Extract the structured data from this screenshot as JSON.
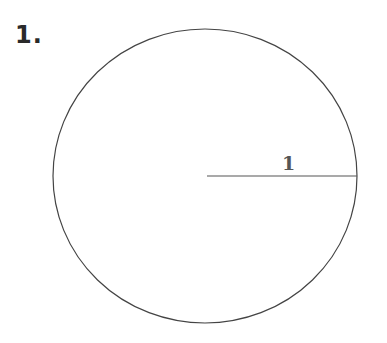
{
  "problem": {
    "number": "1."
  },
  "diagram": {
    "shape": "circle",
    "radius_label": "1",
    "stroke_color": "#444444"
  }
}
